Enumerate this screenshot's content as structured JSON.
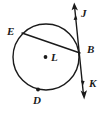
{
  "figure": {
    "kind": "circle-tangent-chord-diagram",
    "background_color": "#ffffff",
    "stroke_color": "#1a1a1a",
    "label_color": "#1a1a1a"
  },
  "circle": {
    "name": "circle-L",
    "center_label": "L",
    "center_x": 46,
    "center_y": 57,
    "radius": 33,
    "stroke_width": 1.4
  },
  "points": [
    {
      "id": "E",
      "label": "E",
      "x": 22,
      "y": 33,
      "label_x": 7,
      "label_y": 27,
      "dot": false
    },
    {
      "id": "B",
      "label": "B",
      "x": 79,
      "y": 52,
      "label_x": 87,
      "label_y": 45,
      "dot": false
    },
    {
      "id": "D",
      "label": "D",
      "x": 38,
      "y": 89,
      "label_x": 33,
      "label_y": 95,
      "dot": true
    },
    {
      "id": "L",
      "label": "L",
      "x": 46,
      "y": 57,
      "label_x": 51,
      "label_y": 53,
      "dot": true
    }
  ],
  "chord": {
    "name": "chord-EB",
    "from": "E",
    "to": "B",
    "from_x": 22,
    "from_y": 33,
    "to_x": 80,
    "to_y": 53,
    "stroke_width": 1.4
  },
  "tangent_line": {
    "name": "line-JK",
    "label_start": "J",
    "label_end": "K",
    "start_x": 74,
    "start_y": 4,
    "end_x": 84,
    "end_y": 97,
    "passes_through": "B",
    "stroke_width": 1.4,
    "arrow_start": true,
    "arrow_end": true,
    "labels": [
      {
        "id": "J",
        "label": "J",
        "label_x": 81,
        "label_y": 9
      },
      {
        "id": "K",
        "label": "K",
        "label_x": 90,
        "label_y": 79
      }
    ]
  },
  "arrowheads": [
    {
      "id": "arrow-J",
      "tip_x": 74,
      "tip_y": 3,
      "direction": "up"
    },
    {
      "id": "arrow-K",
      "tip_x": 84,
      "tip_y": 99,
      "direction": "down"
    }
  ]
}
